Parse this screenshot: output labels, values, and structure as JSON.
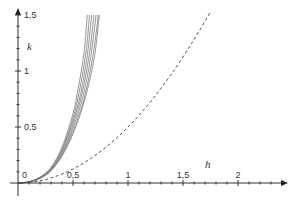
{
  "chart_data": {
    "type": "line",
    "title": "",
    "xlabel": "h",
    "ylabel": "k",
    "xlim": [
      0,
      2.4
    ],
    "ylim": [
      0,
      1.5
    ],
    "grid": false,
    "legend": null,
    "x_ticks": [
      {
        "value": 0.5,
        "label": "0,5"
      },
      {
        "value": 1,
        "label": "1"
      },
      {
        "value": 1.5,
        "label": "1,5"
      },
      {
        "value": 2,
        "label": "2"
      }
    ],
    "y_ticks": [
      {
        "value": 0.5,
        "label": "0,5"
      },
      {
        "value": 1,
        "label": "1"
      },
      {
        "value": 1.5,
        "label": "1,5"
      }
    ],
    "origin_label": "0",
    "minor_tick_step": 0.1,
    "series": [
      {
        "name": "solid-1",
        "style": "solid",
        "color": "#7a7a7a",
        "x": [
          0,
          0.1,
          0.2,
          0.3,
          0.4,
          0.5,
          0.55,
          0.6,
          0.63
        ],
        "y": [
          0,
          0.01,
          0.05,
          0.14,
          0.32,
          0.62,
          0.86,
          1.16,
          1.5
        ]
      },
      {
        "name": "solid-2",
        "style": "solid",
        "color": "#7a7a7a",
        "x": [
          0,
          0.1,
          0.2,
          0.3,
          0.4,
          0.5,
          0.56,
          0.62,
          0.65
        ],
        "y": [
          0,
          0.01,
          0.05,
          0.13,
          0.3,
          0.58,
          0.83,
          1.18,
          1.5
        ]
      },
      {
        "name": "solid-3",
        "style": "solid",
        "color": "#7a7a7a",
        "x": [
          0,
          0.1,
          0.2,
          0.3,
          0.4,
          0.5,
          0.57,
          0.63,
          0.67
        ],
        "y": [
          0,
          0.01,
          0.05,
          0.13,
          0.29,
          0.55,
          0.8,
          1.14,
          1.5
        ]
      },
      {
        "name": "solid-4",
        "style": "solid",
        "color": "#7a7a7a",
        "x": [
          0,
          0.1,
          0.2,
          0.3,
          0.4,
          0.5,
          0.58,
          0.65,
          0.69
        ],
        "y": [
          0,
          0.01,
          0.05,
          0.12,
          0.27,
          0.52,
          0.79,
          1.16,
          1.5
        ]
      },
      {
        "name": "solid-5",
        "style": "solid",
        "color": "#7a7a7a",
        "x": [
          0,
          0.1,
          0.2,
          0.3,
          0.4,
          0.5,
          0.59,
          0.66,
          0.71
        ],
        "y": [
          0,
          0.01,
          0.05,
          0.12,
          0.26,
          0.49,
          0.77,
          1.12,
          1.5
        ]
      },
      {
        "name": "solid-6",
        "style": "solid",
        "color": "#7a7a7a",
        "x": [
          0,
          0.1,
          0.2,
          0.3,
          0.4,
          0.5,
          0.6,
          0.68,
          0.73
        ],
        "y": [
          0,
          0.01,
          0.04,
          0.11,
          0.25,
          0.46,
          0.75,
          1.13,
          1.5
        ]
      },
      {
        "name": "solid-7",
        "style": "solid",
        "color": "#7a7a7a",
        "x": [
          0,
          0.1,
          0.2,
          0.3,
          0.4,
          0.5,
          0.6,
          0.69,
          0.74
        ],
        "y": [
          0,
          0.01,
          0.04,
          0.11,
          0.24,
          0.44,
          0.72,
          1.1,
          1.5
        ]
      },
      {
        "name": "dashed",
        "style": "dashed",
        "color": "#555555",
        "x": [
          0,
          0.2,
          0.4,
          0.6,
          0.8,
          1.0,
          1.2,
          1.4,
          1.6,
          1.75
        ],
        "y": [
          0,
          0.02,
          0.08,
          0.18,
          0.32,
          0.5,
          0.72,
          0.98,
          1.28,
          1.53
        ]
      }
    ]
  },
  "layout": {
    "origin_px": [
      18,
      183
    ],
    "px_per_unit_x": 110,
    "px_per_unit_y": 112,
    "x_axis_end_px": 288,
    "y_axis_top_px": 8,
    "y_axis_bottom_px": 196,
    "x_axis_start_px": 10,
    "h_label_px": [
      205,
      168
    ],
    "k_label_px": [
      27,
      50
    ]
  }
}
